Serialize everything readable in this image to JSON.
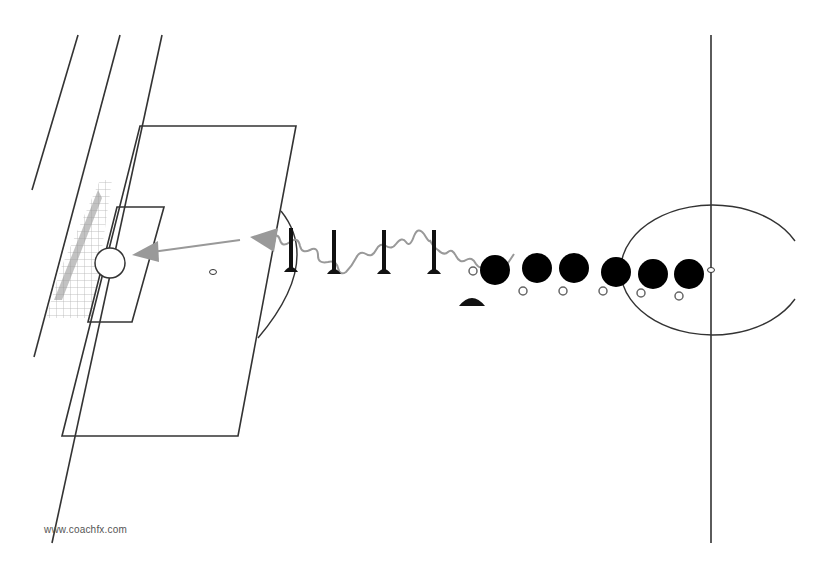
{
  "diagram": {
    "watermark": "www.coachfx.com",
    "colors": {
      "line": "#333333",
      "player": "#000000",
      "ball_fill": "#ffffff",
      "ball_stroke": "#555555",
      "arrow": "#999999",
      "dribble_path": "#999999",
      "net": "#aaaaaa",
      "pole": "#111111",
      "cone": "#111111"
    },
    "pitch": {
      "halfway_line": {
        "x": 711,
        "y1": 35,
        "y2": 543
      },
      "center_spot": {
        "x": 711,
        "y": 270
      },
      "center_circle": {
        "cx": 711,
        "cy": 270,
        "rx": 92,
        "ry": 65
      },
      "goal_lines": [
        {
          "x1": 78,
          "y1": 35,
          "x2": 32,
          "y2": 190
        },
        {
          "x1": 120,
          "y1": 35,
          "x2": 34,
          "y2": 357
        },
        {
          "x1": 162,
          "y1": 35,
          "x2": 52,
          "y2": 543
        }
      ],
      "penalty_box": [
        [
          140,
          126
        ],
        [
          296,
          126
        ],
        [
          238,
          436
        ],
        [
          62,
          436
        ]
      ],
      "six_yard_box": [
        [
          117,
          207
        ],
        [
          164,
          207
        ],
        [
          132,
          322
        ],
        [
          88,
          322
        ]
      ],
      "penalty_spot": {
        "x": 213,
        "y": 272
      },
      "penalty_arc": {
        "path": "M 280 210 Q 320 262 258 338"
      }
    },
    "goal": {
      "circle": {
        "cx": 110,
        "cy": 263,
        "r": 15
      }
    },
    "poles": [
      {
        "x": 291,
        "y_top": 228,
        "y_base": 270
      },
      {
        "x": 334,
        "y_top": 230,
        "y_base": 272
      },
      {
        "x": 384,
        "y_top": 230,
        "y_base": 272
      },
      {
        "x": 434,
        "y_top": 230,
        "y_base": 272
      }
    ],
    "cone": {
      "x": 472,
      "y": 302
    },
    "players": [
      {
        "label": "player-1",
        "x": 495,
        "y": 270,
        "r": 15,
        "ball": {
          "x": 473,
          "y": 271
        }
      },
      {
        "label": "player-2",
        "x": 537,
        "y": 268,
        "r": 15,
        "ball": {
          "x": 523,
          "y": 291
        }
      },
      {
        "label": "player-3",
        "x": 574,
        "y": 268,
        "r": 15,
        "ball": {
          "x": 563,
          "y": 291
        }
      },
      {
        "label": "player-4",
        "x": 616,
        "y": 272,
        "r": 15,
        "ball": {
          "x": 603,
          "y": 291
        }
      },
      {
        "label": "player-5",
        "x": 653,
        "y": 274,
        "r": 15,
        "ball": {
          "x": 641,
          "y": 293
        }
      },
      {
        "label": "player-6",
        "x": 689,
        "y": 274,
        "r": 15,
        "ball": {
          "x": 679,
          "y": 296
        }
      }
    ],
    "shot_arrows": [
      {
        "label": "shot-arrow",
        "x1": 240,
        "y1": 240,
        "x2": 136,
        "y2": 254
      }
    ],
    "dribble_arrow_head": {
      "x": 252,
      "y": 238
    }
  }
}
